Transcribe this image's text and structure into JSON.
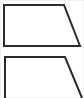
{
  "canvas": {
    "width": 84,
    "height": 98,
    "background_color": "#ffffff",
    "edge_wash_color": "#f2f2f2",
    "description": "Two outlined right-trapezoid figures stacked vertically; the lower one is cut off by the bottom image edge"
  },
  "style": {
    "stroke_color": "#2b2b2b",
    "stroke_width": 2,
    "fill_color": "#ffffff"
  },
  "figures": [
    {
      "name": "right-trapezoid-complete",
      "label": "",
      "closed": true,
      "cropped": false,
      "points": "4,5 64,5 80,46 4,46",
      "vertices": [
        {
          "x": 4,
          "y": 5,
          "role": "top-left"
        },
        {
          "x": 64,
          "y": 5,
          "role": "top-right"
        },
        {
          "x": 80,
          "y": 46,
          "role": "bottom-right"
        },
        {
          "x": 4,
          "y": 46,
          "role": "bottom-left"
        }
      ],
      "edges": [
        {
          "name": "top-edge",
          "orientation": "horizontal"
        },
        {
          "name": "right-slant-edge",
          "orientation": "oblique"
        },
        {
          "name": "bottom-edge",
          "orientation": "horizontal"
        },
        {
          "name": "left-edge",
          "orientation": "vertical"
        }
      ]
    },
    {
      "name": "right-trapezoid-cropped",
      "label": "",
      "closed": false,
      "cropped": true,
      "points": "5,98 5,57 65,57 82,98",
      "vertices": [
        {
          "x": 5,
          "y": 57,
          "role": "top-left"
        },
        {
          "x": 65,
          "y": 57,
          "role": "top-right"
        },
        {
          "x": 82,
          "y": 98,
          "role": "bottom-right-clipped"
        },
        {
          "x": 5,
          "y": 98,
          "role": "bottom-left-clipped"
        }
      ],
      "edges": [
        {
          "name": "top-edge",
          "orientation": "horizontal"
        },
        {
          "name": "right-slant-edge",
          "orientation": "oblique"
        },
        {
          "name": "left-edge",
          "orientation": "vertical"
        }
      ]
    }
  ]
}
